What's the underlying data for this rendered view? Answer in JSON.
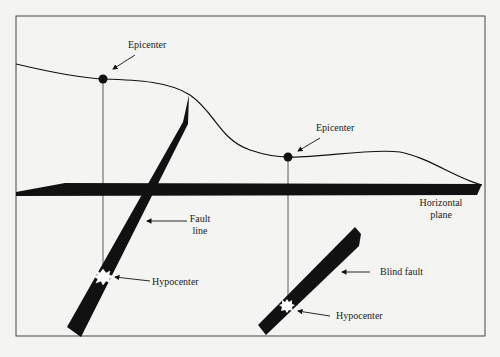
{
  "diagram": {
    "labels": {
      "epicenter_left": "Epicenter",
      "epicenter_right": "Epicenter",
      "fault_line_1": "Fault",
      "fault_line_2": "line",
      "hypocenter_left": "Hypocenter",
      "horizontal_plane_1": "Horizontal",
      "horizontal_plane_2": "plane",
      "blind_fault": "Blind fault",
      "hypocenter_right": "Hypocenter"
    },
    "colors": {
      "ink": "#111111",
      "frame": "#444444",
      "background": "#f4f4f2"
    }
  }
}
